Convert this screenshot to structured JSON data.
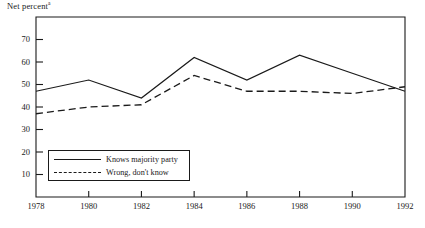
{
  "figure": {
    "axis_title": "Net percent",
    "axis_title_superscript": "a",
    "background": "#ffffff",
    "ink_color": "#1a1a1a"
  },
  "legend": {
    "entries": [
      {
        "label": "Knows majority party",
        "style": "solid"
      },
      {
        "label": "Wrong, don't know",
        "style": "dashed"
      }
    ]
  },
  "chart_data": {
    "type": "line",
    "title": "Net percent",
    "xlabel": "",
    "ylabel": "Net percent",
    "x": [
      1978,
      1980,
      1982,
      1984,
      1986,
      1988,
      1990,
      1992
    ],
    "xtick_labels": [
      "1978",
      "1980",
      "1982",
      "1984",
      "1986",
      "1988",
      "1990",
      "1992"
    ],
    "ytick_labels": [
      "10",
      "20",
      "30",
      "40",
      "50",
      "60",
      "70"
    ],
    "yticks": [
      10,
      20,
      30,
      40,
      50,
      60,
      70
    ],
    "ylim": [
      0,
      80
    ],
    "xlim": [
      1978,
      1992
    ],
    "grid": false,
    "legend_position": "inside lower left",
    "series": [
      {
        "name": "Knows majority party",
        "style": "solid",
        "color": "#1a1a1a",
        "values": [
          47,
          52,
          44,
          62,
          52,
          63,
          55,
          47
        ]
      },
      {
        "name": "Wrong, don't know",
        "style": "dashed",
        "color": "#1a1a1a",
        "values": [
          37,
          40,
          41,
          54,
          47,
          47,
          46,
          49
        ]
      }
    ]
  }
}
